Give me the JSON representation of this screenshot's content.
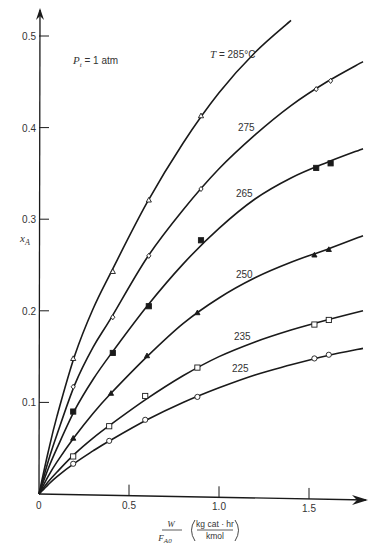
{
  "chart_data": {
    "type": "line",
    "title": "",
    "xlabel": "W / F_A0 (kg cat · hr / kmol)",
    "ylabel": "x_A",
    "xlim": [
      0,
      1.8
    ],
    "ylim": [
      0,
      0.52
    ],
    "x_ticks": [
      "0",
      "0.5",
      "1.0",
      "1.5"
    ],
    "y_ticks": [
      "0.1",
      "0.2",
      "0.3",
      "0.4",
      "0.5"
    ],
    "grid": false,
    "legend": "none (curves labeled inline)",
    "annotations": [
      "P_t = 1 atm",
      "T = 285°C"
    ],
    "series": [
      {
        "name": "285",
        "label": "T = 285°C",
        "marker": "open-triangle",
        "points": [
          [
            0.19,
            0.148
          ],
          [
            0.41,
            0.243
          ],
          [
            0.61,
            0.321
          ],
          [
            0.9,
            0.413
          ]
        ],
        "curve": [
          [
            0,
            0
          ],
          [
            0.05,
            0.045
          ],
          [
            0.1,
            0.085
          ],
          [
            0.2,
            0.152
          ],
          [
            0.3,
            0.202
          ],
          [
            0.4,
            0.242
          ],
          [
            0.6,
            0.318
          ],
          [
            0.8,
            0.383
          ],
          [
            1.0,
            0.438
          ],
          [
            1.2,
            0.482
          ],
          [
            1.4,
            0.517
          ]
        ]
      },
      {
        "name": "275",
        "label": "275",
        "marker": "open-diamond",
        "points": [
          [
            0.19,
            0.117
          ],
          [
            0.41,
            0.193
          ],
          [
            0.61,
            0.26
          ],
          [
            0.9,
            0.333
          ],
          [
            1.54,
            0.442
          ],
          [
            1.62,
            0.451
          ]
        ],
        "curve": [
          [
            0,
            0
          ],
          [
            0.05,
            0.035
          ],
          [
            0.1,
            0.065
          ],
          [
            0.2,
            0.12
          ],
          [
            0.3,
            0.16
          ],
          [
            0.4,
            0.192
          ],
          [
            0.6,
            0.258
          ],
          [
            0.8,
            0.31
          ],
          [
            1.0,
            0.355
          ],
          [
            1.2,
            0.392
          ],
          [
            1.4,
            0.424
          ],
          [
            1.6,
            0.45
          ],
          [
            1.8,
            0.472
          ]
        ]
      },
      {
        "name": "265",
        "label": "265",
        "marker": "filled-square",
        "points": [
          [
            0.19,
            0.09
          ],
          [
            0.41,
            0.154
          ],
          [
            0.61,
            0.205
          ],
          [
            0.9,
            0.277
          ],
          [
            1.54,
            0.356
          ],
          [
            1.62,
            0.361
          ]
        ],
        "curve": [
          [
            0,
            0
          ],
          [
            0.05,
            0.027
          ],
          [
            0.1,
            0.05
          ],
          [
            0.2,
            0.092
          ],
          [
            0.3,
            0.125
          ],
          [
            0.4,
            0.153
          ],
          [
            0.6,
            0.205
          ],
          [
            0.8,
            0.251
          ],
          [
            1.0,
            0.29
          ],
          [
            1.2,
            0.322
          ],
          [
            1.4,
            0.345
          ],
          [
            1.6,
            0.362
          ],
          [
            1.8,
            0.377
          ]
        ]
      },
      {
        "name": "250",
        "label": "250",
        "marker": "filled-triangle",
        "points": [
          [
            0.19,
            0.061
          ],
          [
            0.4,
            0.11
          ],
          [
            0.6,
            0.151
          ],
          [
            0.88,
            0.198
          ],
          [
            1.53,
            0.261
          ],
          [
            1.61,
            0.267
          ]
        ],
        "curve": [
          [
            0,
            0
          ],
          [
            0.05,
            0.019
          ],
          [
            0.1,
            0.035
          ],
          [
            0.2,
            0.063
          ],
          [
            0.3,
            0.088
          ],
          [
            0.4,
            0.11
          ],
          [
            0.6,
            0.15
          ],
          [
            0.8,
            0.186
          ],
          [
            1.0,
            0.214
          ],
          [
            1.2,
            0.236
          ],
          [
            1.4,
            0.253
          ],
          [
            1.6,
            0.267
          ],
          [
            1.8,
            0.282
          ]
        ]
      },
      {
        "name": "235",
        "label": "235",
        "marker": "open-square",
        "points": [
          [
            0.19,
            0.041
          ],
          [
            0.39,
            0.074
          ],
          [
            0.59,
            0.107
          ],
          [
            0.88,
            0.138
          ],
          [
            1.53,
            0.185
          ],
          [
            1.61,
            0.19
          ]
        ],
        "curve": [
          [
            0,
            0
          ],
          [
            0.05,
            0.013
          ],
          [
            0.1,
            0.024
          ],
          [
            0.2,
            0.044
          ],
          [
            0.3,
            0.061
          ],
          [
            0.4,
            0.076
          ],
          [
            0.6,
            0.104
          ],
          [
            0.8,
            0.129
          ],
          [
            1.0,
            0.15
          ],
          [
            1.2,
            0.166
          ],
          [
            1.4,
            0.179
          ],
          [
            1.6,
            0.19
          ],
          [
            1.8,
            0.2
          ]
        ]
      },
      {
        "name": "225",
        "label": "225",
        "marker": "open-circle",
        "points": [
          [
            0.19,
            0.033
          ],
          [
            0.39,
            0.058
          ],
          [
            0.59,
            0.081
          ],
          [
            0.88,
            0.106
          ],
          [
            1.53,
            0.148
          ],
          [
            1.61,
            0.152
          ]
        ],
        "curve": [
          [
            0,
            0
          ],
          [
            0.05,
            0.01
          ],
          [
            0.1,
            0.019
          ],
          [
            0.2,
            0.034
          ],
          [
            0.3,
            0.047
          ],
          [
            0.4,
            0.059
          ],
          [
            0.6,
            0.081
          ],
          [
            0.8,
            0.1
          ],
          [
            1.0,
            0.116
          ],
          [
            1.2,
            0.13
          ],
          [
            1.4,
            0.141
          ],
          [
            1.6,
            0.151
          ],
          [
            1.8,
            0.159
          ]
        ]
      }
    ]
  },
  "labels": {
    "y_axis": "x",
    "y_axis_sub": "A",
    "pressure_p": "P",
    "pressure_sub": "t",
    "pressure_rest": " = 1 atm",
    "x_frac_num": "W",
    "x_frac_den": "F",
    "x_frac_den_sub": "A0",
    "x_unit_num": "kg cat · hr",
    "x_unit_den": "kmol",
    "origin": "0"
  },
  "style": {
    "line_color": "#1a1a1a",
    "axis_color": "#1a1a1a",
    "text_color": "#333333"
  }
}
